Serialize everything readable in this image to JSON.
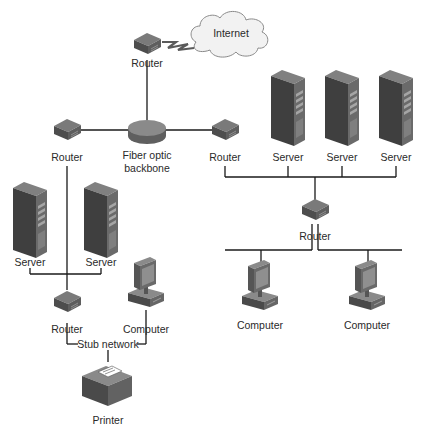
{
  "diagram": {
    "type": "network-topology",
    "nodes": {
      "internet": {
        "label": "Internet"
      },
      "router_top": {
        "label": "Router"
      },
      "backbone": {
        "label_line1": "Fiber optic",
        "label_line2": "backbone"
      },
      "router_left": {
        "label": "Router"
      },
      "router_right": {
        "label": "Router"
      },
      "server_r1": {
        "label": "Server"
      },
      "server_r2": {
        "label": "Server"
      },
      "server_r3": {
        "label": "Server"
      },
      "router_mid_right": {
        "label": "Router"
      },
      "computer_r1": {
        "label": "Computer"
      },
      "computer_r2": {
        "label": "Computer"
      },
      "server_l1": {
        "label": "Server"
      },
      "server_l2": {
        "label": "Server"
      },
      "router_stub": {
        "label": "Router"
      },
      "computer_stub": {
        "label": "Computer"
      },
      "stub_network": {
        "label": "Stub network"
      },
      "printer": {
        "label": "Printer"
      }
    },
    "edges": [
      [
        "router_top",
        "internet",
        "wireless"
      ],
      [
        "router_top",
        "backbone"
      ],
      [
        "backbone",
        "router_left"
      ],
      [
        "backbone",
        "router_right"
      ],
      [
        "router_right",
        "server_r1"
      ],
      [
        "router_right",
        "server_r2"
      ],
      [
        "router_right",
        "server_r3"
      ],
      [
        "router_right",
        "router_mid_right"
      ],
      [
        "router_mid_right",
        "computer_r1"
      ],
      [
        "router_mid_right",
        "computer_r2"
      ],
      [
        "router_left",
        "router_stub"
      ],
      [
        "server_l1",
        "router_stub"
      ],
      [
        "server_l2",
        "router_stub"
      ],
      [
        "router_stub",
        "stub_network"
      ],
      [
        "computer_stub",
        "stub_network"
      ],
      [
        "stub_network",
        "printer"
      ]
    ],
    "colors": {
      "device_dark": "#4a4a4a",
      "device_mid": "#6b6b6b",
      "device_light": "#8e8e8e",
      "cloud_fill": "#f2f2f2",
      "wire": "#1a1a1a"
    }
  }
}
